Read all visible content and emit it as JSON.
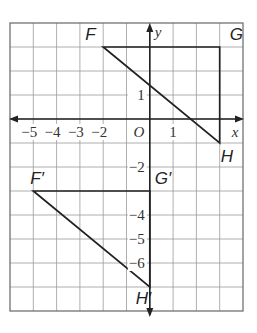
{
  "diagram": {
    "type": "coordinate-plane-translation",
    "grid": {
      "x_min": -6,
      "x_max": 4,
      "y_min": -8,
      "y_max": 4,
      "grid_color": "#9a9a9a",
      "border_color": "#666666"
    },
    "axes": {
      "x_label": "x",
      "y_label": "y",
      "origin_label": "O",
      "x_ticks": [
        {
          "value": -5,
          "label": "−5"
        },
        {
          "value": -4,
          "label": "−4"
        },
        {
          "value": -3,
          "label": "−3"
        },
        {
          "value": -2,
          "label": "−2"
        },
        {
          "value": 1,
          "label": "1"
        }
      ],
      "y_ticks": [
        {
          "value": 1,
          "label": "1"
        },
        {
          "value": -2,
          "label": "−2"
        },
        {
          "value": -4,
          "label": "−4"
        },
        {
          "value": -5,
          "label": "−5"
        },
        {
          "value": -6,
          "label": "−6"
        }
      ]
    },
    "original_triangle": {
      "vertices": [
        {
          "name": "F",
          "label": "F",
          "x": -2,
          "y": 3
        },
        {
          "name": "G",
          "label": "G",
          "x": 3,
          "y": 3
        },
        {
          "name": "H",
          "label": "H",
          "x": 3,
          "y": -1
        }
      ]
    },
    "image_triangle": {
      "vertices": [
        {
          "name": "F'",
          "label": "F′",
          "x": -5,
          "y": -3
        },
        {
          "name": "G'",
          "label": "G′",
          "x": 0,
          "y": -3
        },
        {
          "name": "H'",
          "label": "H′",
          "x": 0,
          "y": -7
        }
      ]
    },
    "line_color": "#222222"
  }
}
